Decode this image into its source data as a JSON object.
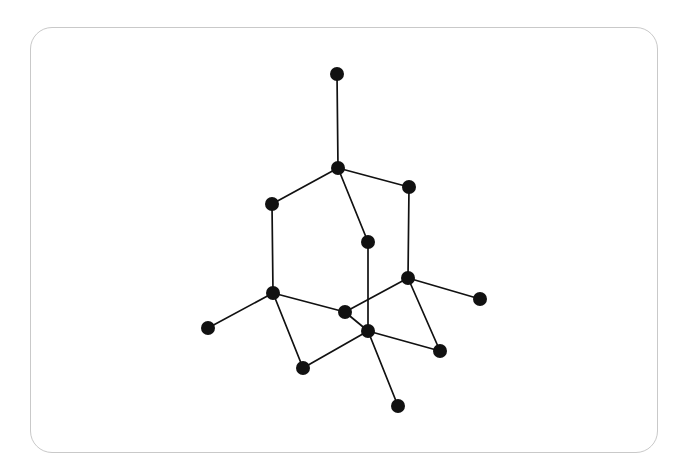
{
  "figure": {
    "kind": "graph-diagram",
    "title": "",
    "background_color": "#ffffff"
  },
  "card": {
    "border_color": "#c9c9c9",
    "border_radius": 22,
    "x": 30,
    "y": 27,
    "width": 628,
    "height": 426
  },
  "chart_data": {
    "type": "scatter",
    "title": "",
    "xlabel": "",
    "ylabel": "",
    "grid": false,
    "legend": null,
    "node_color": "#111111",
    "edge_color": "#111111",
    "node_radius": 7,
    "edge_width": 1.7,
    "node_count": 14,
    "edge_count": 16,
    "nodes": [
      {
        "id": "n0",
        "label": "",
        "x": 337,
        "y": 74,
        "degree": 1
      },
      {
        "id": "n1",
        "label": "",
        "x": 338,
        "y": 168,
        "degree": 4
      },
      {
        "id": "n2",
        "label": "",
        "x": 272,
        "y": 204,
        "degree": 2
      },
      {
        "id": "n3",
        "label": "",
        "x": 409,
        "y": 187,
        "degree": 2
      },
      {
        "id": "n4",
        "label": "",
        "x": 368,
        "y": 242,
        "degree": 2
      },
      {
        "id": "n5",
        "label": "",
        "x": 273,
        "y": 293,
        "degree": 4
      },
      {
        "id": "n6",
        "label": "",
        "x": 208,
        "y": 328,
        "degree": 1
      },
      {
        "id": "n7",
        "label": "",
        "x": 345,
        "y": 312,
        "degree": 3
      },
      {
        "id": "n8",
        "label": "",
        "x": 408,
        "y": 278,
        "degree": 4
      },
      {
        "id": "n9",
        "label": "",
        "x": 480,
        "y": 299,
        "degree": 1
      },
      {
        "id": "n10",
        "label": "",
        "x": 368,
        "y": 331,
        "degree": 5
      },
      {
        "id": "n11",
        "label": "",
        "x": 303,
        "y": 368,
        "degree": 2
      },
      {
        "id": "n12",
        "label": "",
        "x": 440,
        "y": 351,
        "degree": 2
      },
      {
        "id": "n13",
        "label": "",
        "x": 398,
        "y": 406,
        "degree": 1
      }
    ],
    "edges": [
      {
        "source": "n0",
        "target": "n1"
      },
      {
        "source": "n1",
        "target": "n2"
      },
      {
        "source": "n1",
        "target": "n3"
      },
      {
        "source": "n1",
        "target": "n4"
      },
      {
        "source": "n2",
        "target": "n5"
      },
      {
        "source": "n3",
        "target": "n8"
      },
      {
        "source": "n4",
        "target": "n10"
      },
      {
        "source": "n5",
        "target": "n6"
      },
      {
        "source": "n5",
        "target": "n7"
      },
      {
        "source": "n5",
        "target": "n11"
      },
      {
        "source": "n7",
        "target": "n8"
      },
      {
        "source": "n7",
        "target": "n10"
      },
      {
        "source": "n8",
        "target": "n9"
      },
      {
        "source": "n8",
        "target": "n12"
      },
      {
        "source": "n10",
        "target": "n11"
      },
      {
        "source": "n10",
        "target": "n12"
      },
      {
        "source": "n10",
        "target": "n13"
      }
    ]
  }
}
